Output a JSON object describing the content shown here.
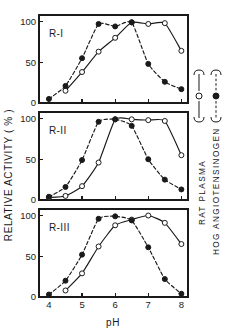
{
  "figure": {
    "ylabel": "RELATIVE   ACTIVITY  ( % )",
    "xlabel": "pH",
    "side_labels": {
      "substrate_a": "RAT  PLASMA",
      "substrate_b": "HOG ANGIOTENSINOGEN"
    }
  },
  "axes": {
    "x_ticks": [
      "4",
      "5",
      "6",
      "7",
      "8"
    ],
    "y_ticks": [
      "0",
      "50",
      "100"
    ],
    "xlim": [
      3.7,
      8.2
    ],
    "ylim": [
      0,
      108
    ]
  },
  "legend": {
    "entries": [
      {
        "marker": "open-circle",
        "line": "solid",
        "label": ""
      },
      {
        "marker": "filled-circle",
        "line": "dashed",
        "label": ""
      }
    ]
  },
  "chart_data": {
    "type": "line",
    "title": "",
    "xlabel": "pH",
    "ylabel": "RELATIVE ACTIVITY ( % )",
    "xlim": [
      3.7,
      8.2
    ],
    "ylim": [
      0,
      108
    ],
    "grid": false,
    "legend_position": "right",
    "panels": [
      {
        "label": "R-I",
        "series": [
          {
            "name": "RAT PLASMA",
            "marker": "open-circle",
            "line": "solid",
            "x": [
              4.5,
              5.0,
              5.5,
              6.0,
              6.5,
              7.0,
              7.5,
              8.0
            ],
            "y": [
              15,
              38,
              63,
              80,
              99,
              97,
              98,
              64
            ]
          },
          {
            "name": "HOG ANGIOTENSINOGEN",
            "marker": "filled-circle",
            "line": "dashed",
            "x": [
              4.0,
              4.5,
              5.0,
              5.5,
              6.0,
              6.5,
              7.0,
              7.5,
              8.0
            ],
            "y": [
              5,
              21,
              55,
              97,
              94,
              99,
              48,
              26,
              17
            ]
          }
        ]
      },
      {
        "label": "R-II",
        "series": [
          {
            "name": "RAT PLASMA",
            "marker": "open-circle",
            "line": "solid",
            "x": [
              4.0,
              4.5,
              5.0,
              5.5,
              6.0,
              6.5,
              7.0,
              7.5,
              8.0
            ],
            "y": [
              3,
              5,
              17,
              46,
              99,
              99,
              98,
              97,
              55
            ]
          },
          {
            "name": "HOG ANGIOTENSINOGEN",
            "marker": "filled-circle",
            "line": "dashed",
            "x": [
              4.0,
              4.5,
              5.0,
              5.5,
              6.0,
              6.5,
              7.0,
              7.5,
              8.0
            ],
            "y": [
              4,
              16,
              49,
              96,
              99,
              91,
              50,
              25,
              13
            ]
          }
        ]
      },
      {
        "label": "R-III",
        "series": [
          {
            "name": "RAT PLASMA",
            "marker": "open-circle",
            "line": "solid",
            "x": [
              4.5,
              5.0,
              5.5,
              6.0,
              6.5,
              7.0,
              7.5,
              8.0
            ],
            "y": [
              8,
              29,
              62,
              88,
              95,
              100,
              91,
              65
            ]
          },
          {
            "name": "HOG ANGIOTENSINOGEN",
            "marker": "filled-circle",
            "line": "dashed",
            "x": [
              4.0,
              4.5,
              5.0,
              5.5,
              6.0,
              6.5,
              7.0,
              7.5,
              8.0
            ],
            "y": [
              3,
              20,
              52,
              96,
              99,
              94,
              61,
              22,
              4
            ]
          }
        ]
      }
    ]
  }
}
